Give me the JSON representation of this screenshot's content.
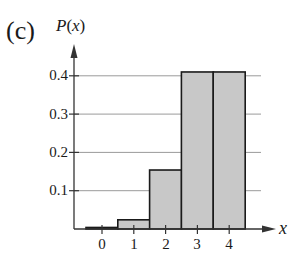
{
  "panel_label": "(c)",
  "chart_data": {
    "type": "bar",
    "title": "",
    "xlabel": "x",
    "ylabel": "P(x)",
    "categories": [
      "0",
      "1",
      "2",
      "3",
      "4"
    ],
    "values": [
      0.004,
      0.024,
      0.154,
      0.41,
      0.41
    ],
    "ylim": [
      0,
      0.45
    ],
    "yticks": [
      "0.1",
      "0.2",
      "0.3",
      "0.4"
    ],
    "ytick_values": [
      0.1,
      0.2,
      0.3,
      0.4
    ],
    "grid": true,
    "legend": null,
    "bar_color": "#c8c8c8",
    "edge_color": "#1a1a1a"
  },
  "labels": {
    "ylabel_prefix": "P",
    "ylabel_var": "x",
    "xlabel": "x",
    "ytick_0": "0.4",
    "ytick_1": "0.3",
    "ytick_2": "0.2",
    "ytick_3": "0.1",
    "xtick_0": "0",
    "xtick_1": "1",
    "xtick_2": "2",
    "xtick_3": "3",
    "xtick_4": "4"
  }
}
